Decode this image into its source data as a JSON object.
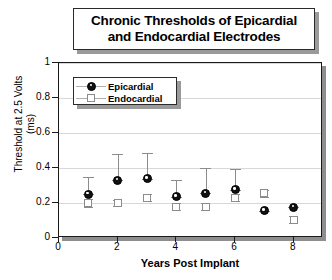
{
  "title": {
    "line1": "Chronic Thresholds of Epicardial",
    "line2": "and Endocardial Electrodes"
  },
  "legend": {
    "items": [
      {
        "label": "Epicardial",
        "marker": "filled-circle",
        "color": "#111111"
      },
      {
        "label": "Endocardial",
        "marker": "open-square",
        "color": "#8c8c8c"
      }
    ]
  },
  "axes": {
    "y_label_line1": "Threshold at 2.5 Volts",
    "y_label_line2": "(ms)",
    "x_label": "Years Post Implant",
    "y_ticks": [
      "0",
      "0.2",
      "0.4",
      "0.6",
      "0.8",
      "1"
    ],
    "x_ticks": [
      "0",
      "2",
      "4",
      "6",
      "8"
    ]
  },
  "chart_data": {
    "type": "scatter",
    "title": "Chronic Thresholds of Epicardial and Endocardial Electrodes",
    "xlabel": "Years Post Implant",
    "ylabel": "Threshold at 2.5 Volts (ms)",
    "xlim": [
      0,
      9
    ],
    "ylim": [
      0,
      1
    ],
    "grid": true,
    "legend_position": "upper-left",
    "x": [
      1,
      2,
      3,
      4,
      5,
      6,
      7,
      8
    ],
    "series": [
      {
        "name": "Epicardial",
        "marker": "filled-circle",
        "color": "#111111",
        "values": [
          0.25,
          0.33,
          0.34,
          0.235,
          0.255,
          0.275,
          0.155,
          0.175
        ],
        "err_upper": [
          0.35,
          0.48,
          0.485,
          0.33,
          0.4,
          0.395,
          0.155,
          0.175
        ],
        "err_lower": [
          0.25,
          0.33,
          0.34,
          0.235,
          0.255,
          0.275,
          0.155,
          0.175
        ]
      },
      {
        "name": "Endocardial",
        "marker": "open-square",
        "color": "#8c8c8c",
        "values": [
          0.2,
          0.2,
          0.23,
          0.18,
          0.18,
          0.23,
          0.255,
          0.105
        ],
        "err_upper": [
          0.225,
          0.215,
          0.25,
          0.2,
          0.2,
          0.25,
          0.275,
          0.125
        ],
        "err_lower": [
          0.175,
          0.185,
          0.21,
          0.16,
          0.16,
          0.21,
          0.235,
          0.085
        ]
      }
    ]
  }
}
